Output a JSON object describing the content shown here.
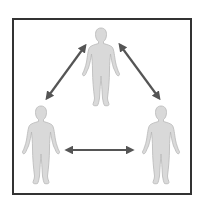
{
  "diagram": {
    "type": "relationship-triangle",
    "colors": {
      "background": "#ffffff",
      "frame_border": "#333333",
      "figure_fill": "#d9d9d9",
      "figure_stroke": "#b8b8b8",
      "arrow": "#555555"
    },
    "figures": [
      {
        "id": "top",
        "position": "top-center",
        "cx": 101,
        "top": 28,
        "height": 78
      },
      {
        "id": "left",
        "position": "bottom-left",
        "cx": 41,
        "top": 106,
        "height": 78
      },
      {
        "id": "right",
        "position": "bottom-right",
        "cx": 161,
        "top": 106,
        "height": 78
      }
    ],
    "arrows": [
      {
        "id": "top-left",
        "from": "top",
        "to": "left",
        "direction": "bidirectional",
        "x1": 85,
        "y1": 46,
        "x2": 47,
        "y2": 98
      },
      {
        "id": "top-right",
        "from": "top",
        "to": "right",
        "direction": "bidirectional",
        "x1": 120,
        "y1": 45,
        "x2": 159,
        "y2": 98
      },
      {
        "id": "left-right",
        "from": "left",
        "to": "right",
        "direction": "bidirectional",
        "x1": 67,
        "y1": 150,
        "x2": 132,
        "y2": 150
      }
    ]
  }
}
